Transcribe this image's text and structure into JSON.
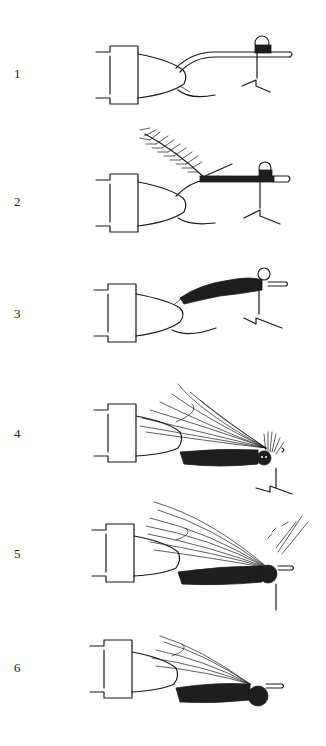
{
  "figure": {
    "ink_color": "#1a1a1a",
    "background": "#ffffff"
  },
  "steps": [
    {
      "number": "1",
      "top": 12,
      "label_y": 66,
      "stage": "bare-hook-thread"
    },
    {
      "number": "2",
      "top": 120,
      "label_y": 78,
      "stage": "hackle-tied-in"
    },
    {
      "number": "3",
      "top": 250,
      "label_y": 62,
      "stage": "body-wrapped"
    },
    {
      "number": "4",
      "top": 372,
      "label_y": 60,
      "stage": "wing-added"
    },
    {
      "number": "5",
      "top": 492,
      "label_y": 60,
      "stage": "hackle-wound"
    },
    {
      "number": "6",
      "top": 612,
      "label_y": 56,
      "stage": "finished-fly"
    }
  ]
}
